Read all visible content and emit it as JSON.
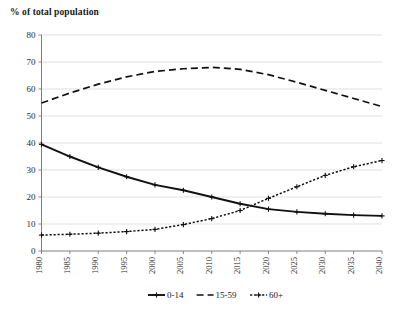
{
  "chart_data": {
    "type": "line",
    "title": "% of total population",
    "xlabel": "",
    "ylabel": "% of total population",
    "ylim": [
      0,
      80
    ],
    "ytick_step": 10,
    "yticks": [
      0,
      10,
      20,
      30,
      40,
      50,
      60,
      70,
      80
    ],
    "grid": true,
    "legend_position": "bottom",
    "categories": [
      "1980",
      "1985",
      "1990",
      "1995",
      "2000",
      "2005",
      "2010",
      "2015",
      "2020",
      "2025",
      "2030",
      "2035",
      "2040"
    ],
    "x": [
      1980,
      1985,
      1990,
      1995,
      2000,
      2005,
      2010,
      2015,
      2020,
      2025,
      2030,
      2035,
      2040
    ],
    "series": [
      {
        "name": "0-14",
        "style": "solid-with-markers",
        "color": "#111111",
        "values": [
          39.5,
          35.0,
          31.0,
          27.5,
          24.5,
          22.5,
          20.0,
          17.5,
          15.5,
          14.5,
          13.8,
          13.3,
          13.0
        ]
      },
      {
        "name": "15-59",
        "style": "dashed",
        "color": "#111111",
        "values": [
          54.8,
          58.5,
          61.8,
          64.5,
          66.5,
          67.5,
          68.0,
          67.3,
          65.3,
          62.5,
          59.5,
          56.5,
          53.5
        ]
      },
      {
        "name": "60+",
        "style": "dotted-with-markers",
        "color": "#111111",
        "values": [
          5.9,
          6.2,
          6.6,
          7.2,
          8.0,
          9.8,
          12.0,
          15.0,
          19.5,
          23.8,
          28.0,
          31.2,
          33.5
        ]
      }
    ],
    "legend": [
      {
        "label": "0-14",
        "style": "solid-with-markers"
      },
      {
        "label": "15-59",
        "style": "dashed"
      },
      {
        "label": "60+",
        "style": "dotted-with-markers"
      }
    ]
  }
}
